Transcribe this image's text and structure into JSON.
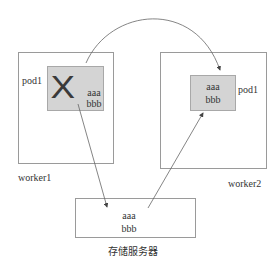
{
  "diagram": {
    "worker1": {
      "label": "worker1"
    },
    "worker2": {
      "label": "worker2"
    },
    "pod_left": {
      "label": "pod1",
      "lines": [
        "aaa",
        "bbb"
      ],
      "status_icon": "x-mark-icon",
      "fill": "#d4d4d4"
    },
    "pod_right": {
      "label": "pod1",
      "lines": [
        "aaa",
        "bbb"
      ],
      "fill": "#d4d4d4"
    },
    "storage": {
      "label": "存储服务器",
      "lines": [
        "aaa",
        "bbb"
      ]
    },
    "x_mark": "X",
    "arrows": [
      {
        "from": "pod_left",
        "to": "pod_right",
        "kind": "curved"
      },
      {
        "from": "pod_left",
        "to": "storage",
        "kind": "straight"
      },
      {
        "from": "storage",
        "to": "pod_right",
        "kind": "straight"
      }
    ],
    "line_color": "#555555"
  }
}
